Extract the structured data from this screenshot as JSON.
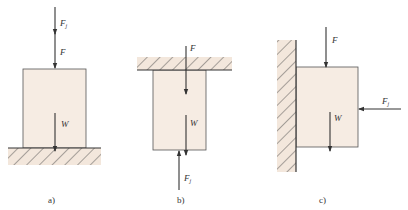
{
  "colors": {
    "block_fill": "#f6ece3",
    "hatch_fill": "#f3e7dc",
    "line": "#333333",
    "background": "#ffffff"
  },
  "figures": [
    {
      "caption": "a)",
      "support": "ground",
      "labels": {
        "fj_main": "F",
        "fj_sub": "j",
        "f": "F",
        "w": "W"
      }
    },
    {
      "caption": "b)",
      "support": "ceiling",
      "labels": {
        "f": "F",
        "w": "W",
        "fj_main": "F",
        "fj_sub": "j"
      }
    },
    {
      "caption": "c)",
      "support": "wall",
      "labels": {
        "f": "F",
        "w": "W",
        "fj_main": "F",
        "fj_sub": "j"
      }
    }
  ]
}
